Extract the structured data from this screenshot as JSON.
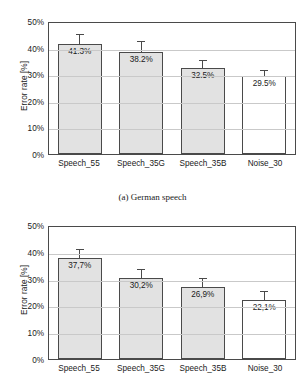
{
  "chart_data": [
    {
      "id": "german-speech",
      "type": "bar",
      "title": "",
      "caption": "(a) German speech",
      "xlabel": "",
      "ylabel": "Error rate [%]",
      "categories": [
        "Speech_55",
        "Speech_35G",
        "Speech_35B",
        "Noise_30"
      ],
      "values": [
        41.3,
        38.2,
        32.5,
        29.5
      ],
      "value_labels": [
        "41.3%",
        "38.2%",
        "32.5%",
        "29.5%"
      ],
      "errors_upper": [
        3.8,
        4.2,
        3.0,
        2.2
      ],
      "ylim": [
        0,
        50
      ],
      "yticks": [
        0,
        10,
        20,
        30,
        40,
        50
      ],
      "ytick_labels": [
        "0%",
        "10%",
        "20%",
        "30%",
        "40%",
        "50%"
      ],
      "grid": true,
      "legend": "none",
      "bar_fills": [
        "filled",
        "filled",
        "filled",
        "open"
      ]
    },
    {
      "id": "second-panel",
      "type": "bar",
      "title": "",
      "caption": "",
      "xlabel": "",
      "ylabel": "Error rate [%]",
      "categories": [
        "Speech_55",
        "Speech_35G",
        "Speech_35B",
        "Noise_30"
      ],
      "values": [
        37.7,
        30.2,
        26.9,
        22.1
      ],
      "value_labels": [
        "37,7%",
        "30,2%",
        "26,9%",
        "22,1%"
      ],
      "errors_upper": [
        3.3,
        3.3,
        3.2,
        3.2
      ],
      "ylim": [
        0,
        50
      ],
      "yticks": [
        0,
        10,
        20,
        30,
        40,
        50
      ],
      "ytick_labels": [
        "0%",
        "10%",
        "20%",
        "30%",
        "40%",
        "50%"
      ],
      "grid": true,
      "legend": "none",
      "bar_fills": [
        "filled",
        "filled",
        "filled",
        "open"
      ]
    }
  ],
  "colors": {
    "bar_fill": "#e2e2e2",
    "bar_open": "#ffffff",
    "bar_stroke": "#4a4a4a",
    "gridline": "#c9c9c9",
    "text": "#1a1a1a",
    "background": "#ffffff"
  }
}
